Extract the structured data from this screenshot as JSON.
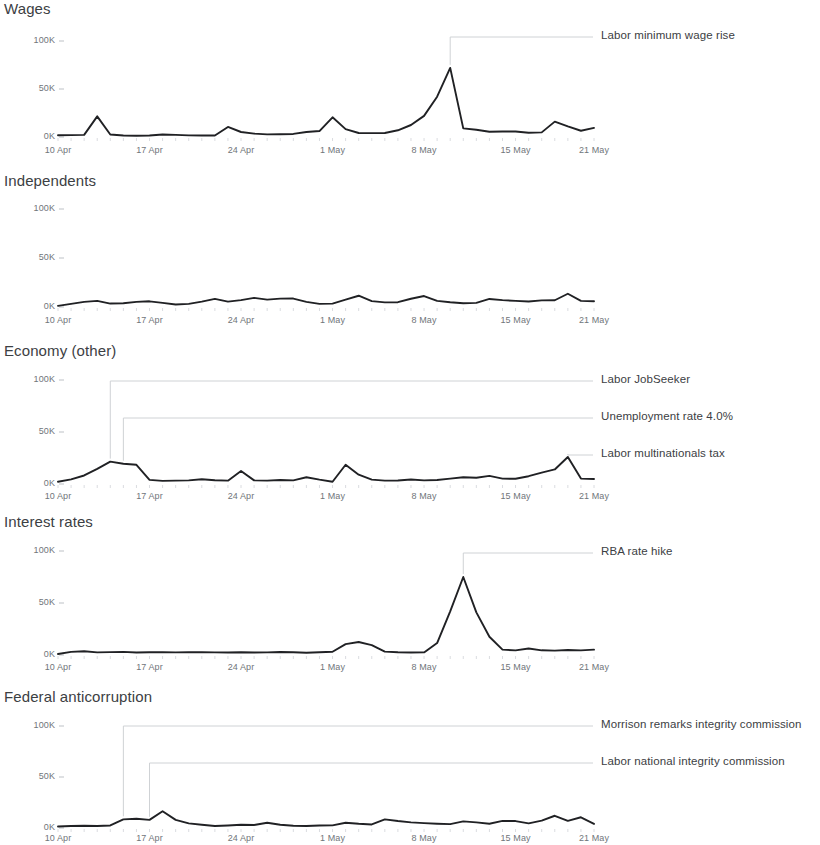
{
  "page": {
    "background": "#ffffff",
    "line_color": "#202124",
    "axis_label_color": "#70757a",
    "title_color": "#3c4043",
    "annotation_line_color": "#cfd2d5",
    "annotation_text_color": "#3c4043"
  },
  "axis": {
    "y_ticks": [
      "0K",
      "50K",
      "100K"
    ],
    "y_values": [
      0,
      50000,
      100000
    ],
    "x_ticks": [
      "10 Apr",
      "17 Apr",
      "24 Apr",
      "1 May",
      "8 May",
      "15 May",
      "21 May"
    ],
    "x_tick_days": [
      0,
      7,
      14,
      21,
      28,
      35,
      41
    ]
  },
  "chart_data": [
    {
      "type": "line",
      "title": "Wages",
      "xlabel": "",
      "ylabel": "",
      "ylim": [
        0,
        100000
      ],
      "grid": false,
      "legend": "none",
      "x": [
        "10 Apr",
        "11 Apr",
        "12 Apr",
        "13 Apr",
        "14 Apr",
        "15 Apr",
        "16 Apr",
        "17 Apr",
        "18 Apr",
        "19 Apr",
        "20 Apr",
        "21 Apr",
        "22 Apr",
        "23 Apr",
        "24 Apr",
        "25 Apr",
        "26 Apr",
        "27 Apr",
        "28 Apr",
        "29 Apr",
        "30 Apr",
        "1 May",
        "2 May",
        "3 May",
        "4 May",
        "5 May",
        "6 May",
        "7 May",
        "8 May",
        "9 May",
        "10 May",
        "11 May",
        "12 May",
        "13 May",
        "14 May",
        "15 May",
        "16 May",
        "17 May",
        "18 May",
        "19 May",
        "20 May",
        "21 May"
      ],
      "values": [
        1800,
        2000,
        2200,
        21500,
        2600,
        1500,
        1300,
        1500,
        2600,
        2200,
        1700,
        1600,
        1500,
        10500,
        5200,
        3500,
        2700,
        2800,
        3200,
        5200,
        6200,
        20500,
        8200,
        4200,
        4000,
        4200,
        7000,
        12500,
        22000,
        42000,
        72000,
        9000,
        7500,
        5500,
        5800,
        5800,
        4500,
        4800,
        16000,
        11000,
        6500,
        9500
      ],
      "annotations": [
        {
          "label": "Labor minimum wage rise",
          "x_index": 30,
          "value": 72000,
          "text_y": 37
        }
      ]
    },
    {
      "type": "line",
      "title": "Independents",
      "xlabel": "",
      "ylabel": "",
      "ylim": [
        0,
        100000
      ],
      "grid": false,
      "legend": "none",
      "x": [
        "10 Apr",
        "11 Apr",
        "12 Apr",
        "13 Apr",
        "14 Apr",
        "15 Apr",
        "16 Apr",
        "17 Apr",
        "18 Apr",
        "19 Apr",
        "20 Apr",
        "21 Apr",
        "22 Apr",
        "23 Apr",
        "24 Apr",
        "25 Apr",
        "26 Apr",
        "27 Apr",
        "28 Apr",
        "29 Apr",
        "30 Apr",
        "1 May",
        "2 May",
        "3 May",
        "4 May",
        "5 May",
        "6 May",
        "7 May",
        "8 May",
        "9 May",
        "10 May",
        "11 May",
        "12 May",
        "13 May",
        "14 May",
        "15 May",
        "16 May",
        "17 May",
        "18 May",
        "19 May",
        "20 May",
        "21 May"
      ],
      "values": [
        1200,
        3200,
        5200,
        6300,
        3500,
        3800,
        5200,
        5800,
        4200,
        2600,
        3200,
        5500,
        8300,
        5500,
        7000,
        9300,
        7500,
        8500,
        8600,
        5200,
        3200,
        3400,
        7500,
        11500,
        6000,
        4700,
        4900,
        8400,
        11200,
        6200,
        4800,
        3800,
        4200,
        8200,
        7000,
        6300,
        5600,
        6800,
        6900,
        13500,
        6200,
        5800
      ],
      "annotations": []
    },
    {
      "type": "line",
      "title": "Economy (other)",
      "xlabel": "",
      "ylabel": "",
      "ylim": [
        0,
        100000
      ],
      "grid": false,
      "legend": "none",
      "x": [
        "10 Apr",
        "11 Apr",
        "12 Apr",
        "13 Apr",
        "14 Apr",
        "15 Apr",
        "16 Apr",
        "17 Apr",
        "18 Apr",
        "19 Apr",
        "20 Apr",
        "21 Apr",
        "22 Apr",
        "23 Apr",
        "24 Apr",
        "25 Apr",
        "26 Apr",
        "27 Apr",
        "28 Apr",
        "29 Apr",
        "30 Apr",
        "1 May",
        "2 May",
        "3 May",
        "4 May",
        "5 May",
        "6 May",
        "7 May",
        "8 May",
        "9 May",
        "10 May",
        "11 May",
        "12 May",
        "13 May",
        "14 May",
        "15 May",
        "16 May",
        "17 May",
        "18 May",
        "19 May",
        "20 May",
        "21 May"
      ],
      "values": [
        2200,
        4500,
        8200,
        14500,
        21500,
        19500,
        18500,
        4000,
        3000,
        3200,
        3500,
        4500,
        3600,
        3200,
        12500,
        3500,
        3200,
        3800,
        3500,
        6500,
        4200,
        2200,
        18500,
        9000,
        4200,
        3200,
        3400,
        4300,
        3500,
        3800,
        5200,
        6500,
        6000,
        7800,
        5200,
        5000,
        7500,
        11000,
        14000,
        26000,
        5200,
        4800
      ],
      "annotations": [
        {
          "label": "Labor JobSeeker",
          "x_index": 4,
          "value": 21500,
          "text_y": 381
        },
        {
          "label": "Unemployment rate 4.0%",
          "x_index": 5,
          "value": 19500,
          "text_y": 418
        },
        {
          "label": "Labor multinationals tax",
          "x_index": 39,
          "value": 26000,
          "text_y": 455
        }
      ]
    },
    {
      "type": "line",
      "title": "Interest rates",
      "xlabel": "",
      "ylabel": "",
      "ylim": [
        0,
        100000
      ],
      "grid": false,
      "legend": "none",
      "x": [
        "10 Apr",
        "11 Apr",
        "12 Apr",
        "13 Apr",
        "14 Apr",
        "15 Apr",
        "16 Apr",
        "17 Apr",
        "18 Apr",
        "19 Apr",
        "20 Apr",
        "21 Apr",
        "22 Apr",
        "23 Apr",
        "24 Apr",
        "25 Apr",
        "26 Apr",
        "27 Apr",
        "28 Apr",
        "29 Apr",
        "30 Apr",
        "1 May",
        "2 May",
        "3 May",
        "4 May",
        "5 May",
        "6 May",
        "7 May",
        "8 May",
        "9 May",
        "10 May",
        "11 May",
        "12 May",
        "13 May",
        "14 May",
        "15 May",
        "16 May",
        "17 May",
        "18 May",
        "19 May",
        "20 May",
        "21 May"
      ],
      "values": [
        900,
        3000,
        3600,
        2500,
        2800,
        3000,
        2400,
        2600,
        2800,
        2500,
        2600,
        2700,
        2500,
        2400,
        2600,
        2400,
        2500,
        2900,
        2600,
        2200,
        2600,
        3100,
        10500,
        12500,
        9500,
        3200,
        2600,
        2400,
        2500,
        11500,
        42000,
        75000,
        41000,
        17500,
        5200,
        4400,
        6200,
        4500,
        4200,
        4800,
        4400,
        5200
      ],
      "annotations": [
        {
          "label": "RBA rate hike",
          "x_index": 31,
          "value": 75000,
          "text_y": 553
        }
      ]
    },
    {
      "type": "line",
      "title": "Federal anticorruption",
      "xlabel": "",
      "ylabel": "",
      "ylim": [
        0,
        100000
      ],
      "grid": false,
      "legend": "none",
      "x": [
        "10 Apr",
        "11 Apr",
        "12 Apr",
        "13 Apr",
        "14 Apr",
        "15 Apr",
        "16 Apr",
        "17 Apr",
        "18 Apr",
        "19 Apr",
        "20 Apr",
        "21 Apr",
        "22 Apr",
        "23 Apr",
        "24 Apr",
        "25 Apr",
        "26 Apr",
        "27 Apr",
        "28 Apr",
        "29 Apr",
        "30 Apr",
        "1 May",
        "2 May",
        "3 May",
        "4 May",
        "5 May",
        "6 May",
        "7 May",
        "8 May",
        "9 May",
        "10 May",
        "11 May",
        "12 May",
        "13 May",
        "14 May",
        "15 May",
        "16 May",
        "17 May",
        "18 May",
        "19 May",
        "20 May",
        "21 May"
      ],
      "values": [
        1500,
        2000,
        2200,
        2000,
        2500,
        8500,
        9000,
        8000,
        16500,
        8000,
        4500,
        3200,
        2000,
        2500,
        3200,
        3000,
        5200,
        3200,
        2200,
        2000,
        2400,
        2600,
        5200,
        4200,
        3500,
        8500,
        6800,
        5500,
        4800,
        4200,
        3800,
        6500,
        5500,
        4200,
        7000,
        6800,
        4500,
        7200,
        12000,
        7000,
        10500,
        4000
      ],
      "annotations": [
        {
          "label": "Morrison remarks integrity commission",
          "x_index": 5,
          "value": 8500,
          "text_y": 726
        },
        {
          "label": "Labor national integrity commission",
          "x_index": 7,
          "value": 8000,
          "text_y": 763
        }
      ]
    }
  ]
}
